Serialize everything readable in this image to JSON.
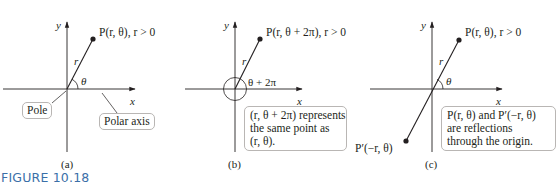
{
  "figure": {
    "label": "FIGURE 10.18",
    "panels": [
      {
        "id": "a",
        "caption": "(a)",
        "axis_x": "x",
        "axis_y": "y",
        "point_label": "P(r, θ), r > 0",
        "radius_label": "r",
        "angle_label": "θ",
        "callouts": [
          "Pole",
          "Polar axis"
        ]
      },
      {
        "id": "b",
        "caption": "(b)",
        "axis_x": "x",
        "axis_y": "y",
        "point_label": "P(r, θ + 2π), r > 0",
        "radius_label": "r",
        "angle_label": "θ + 2π",
        "note_lines": [
          "(r, θ + 2π) represents",
          "the same point as",
          "(r, θ)."
        ]
      },
      {
        "id": "c",
        "caption": "(c)",
        "axis_x": "x",
        "axis_y": "y",
        "point_label": "P(r, θ), r > 0",
        "reflected_point_label": "P′(−r, θ)",
        "radius_label": "r",
        "angle_label": "θ",
        "note_lines": [
          "P(r, θ) and P′(−r, θ)",
          "are reflections",
          "through the origin."
        ]
      }
    ],
    "colors": {
      "ink": "#231f20",
      "box_border": "#b9b6b4",
      "figure_label": "#3a6fa8"
    }
  }
}
